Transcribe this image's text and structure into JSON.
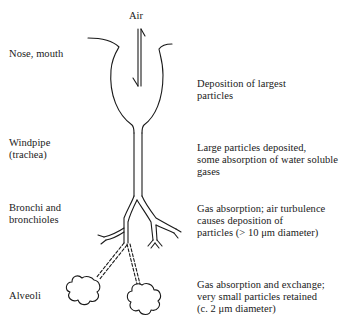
{
  "diagram": {
    "type": "respiratory-tract-particle-deposition",
    "airflow_label": "Air",
    "regions": [
      {
        "name": "Nose, mouth",
        "description": "Deposition of largest\nparticles"
      },
      {
        "name": "Windpipe\n(trachea)",
        "description": "Large particles deposited,\nsome absorption of water soluble\ngases"
      },
      {
        "name": "Bronchi and\nbronchioles",
        "description": "Gas absorption; air turbulence\ncauses deposition of\nparticles (> 10 μm diameter)"
      },
      {
        "name": "Alveoli",
        "description": "Gas absorption and exchange;\nvery small particles retained\n(c. 2 μm diameter)"
      }
    ]
  }
}
